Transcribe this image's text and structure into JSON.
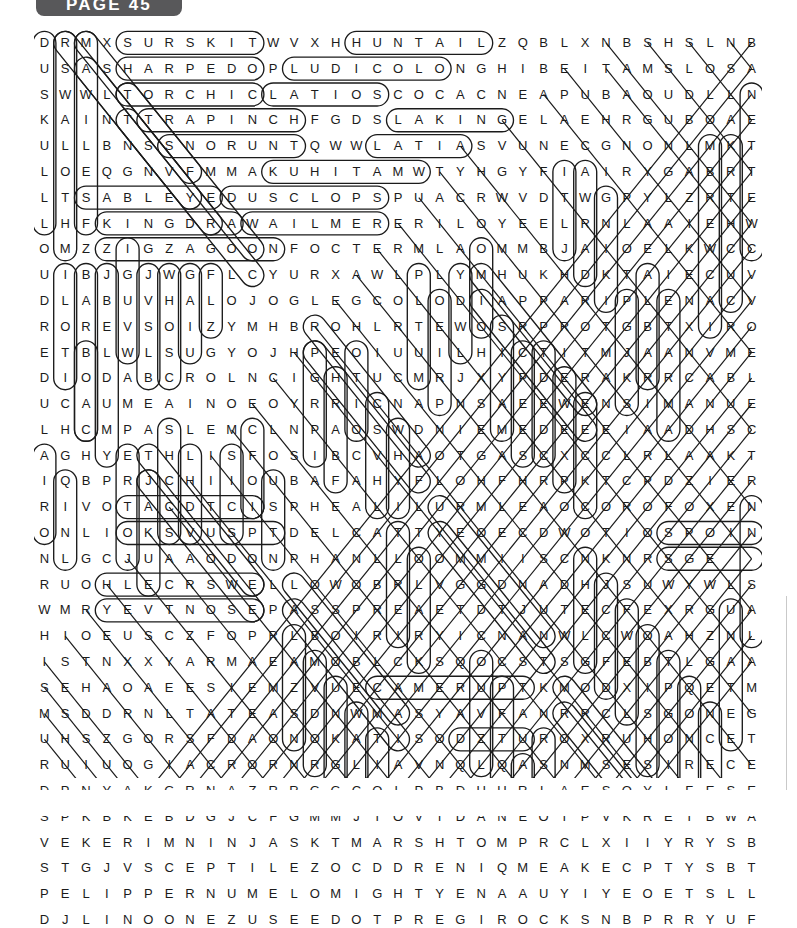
{
  "header": {
    "page_label": "PAGE 45"
  },
  "puzzle": {
    "kind": "word-search-solution",
    "rows": 29,
    "cols": 35,
    "ink_color": "#1b1b1b",
    "tab_color": "#58585a",
    "grid": [
      "DRMXSURSKITWVXHHUNTAILZQBLXNBSHSLNB",
      "USASHARPEDOPLUDICOLONGHIBEITAMSLOSA",
      "SWWLTORCHICLATIOSCOCACNEAPUBAOUDLLN",
      "KAINTTRAPINCHFGDSLAKINGELAEHRGUBOAE",
      "ULLBNSSNORUNTQWWLATIASVUNECGNONLMKT",
      "LOEQGNVFMMAKUHITAMWTYHGYFIAIRYGABRT",
      "LTSABLEYEDUSCLOPSPUACRWVDTWGPYLZRTE",
      "LHFKINGDRAWAILMERERILOYEELRNLAAIEHW",
      "OMZZIGZAGOONFOCTERMLAOMMBJAIOELKWCC",
      "UIBJGJWGFLCYURXAWLPLYMHUKHDKTAIECUV",
      "DLABUVHALOJOGLEGCOLODIAPPARIPLENACV",
      "ROREVSOIZYMHBROHLRTEWOSRPROTGBTXIRO",
      "ETBLWLSUGYOJHPEOIUUILHICTITMJAANVME",
      "DIODABCROLNCIGHTUCMRJXYPDERAKRRCABL",
      "UCAUMEAINOEOYRRICNAPNSAEEWENSIMANUE",
      "LHCMPASLEMCLNPAOSWDNIEMEDEEEIAADHSC",
      "AGHYETHLISFOSIBCVHAOTGASCXCCLRLAAKT",
      "IQBPRJCHIIOUBAFAHYFLOHFHRPKTCPDZIER",
      "RIVOTACDTCISPHEALILURMLEAOCOROFOXEN",
      "ONLIOKSVUSPTDELCATTYEOECDWOTIOSPOIN",
      "NLGCJUAAODONPHANLLOOMMIISCNKNRSGE",
      "RUOHLECRSWELLOWOBRLVGGDNADHJSUWYWLS",
      "WMRYEVTNOSEPASSPREAETDTJUTECFEXRGUA",
      "HIOEUSCZFOPRLBOIRIRYICNANWLCWOAHZNL",
      "ISTNXXYARMAEAMOBLCKSQOCSTSGFEBTLGAA",
      "SEHAOAEESIEMZVUECAMERUPTKMODXIPQETM",
      "MSDDRNLTATEASDNWMASYAVFANRRCLSGONEG",
      "UHSZGORSFDAONOKATISODZTUROXRUHONCET",
      "RUIUOGIACRORNRGLIAVNQLQASNMSESIRECE"
    ],
    "grid_tail": [
      "DPNYAKGRNAZRRGGCOLPBDUURLAESOYLFESEA",
      "SPKBKEBDGJCFGMMJTOVIDANEOIPVKRETBWAG",
      "VEKERIMNINJASKTMARSHTOMPRCLXIIYRYSBT",
      "STGJVSCEPTILEZOCDDRENIQMEAKECPTYSBTL",
      "PELIPPERNUMELOMIGHTYENAAUYIYEOETSLLF",
      "DJLINOONEZUSEEDOTPREGIROCKSNBPRRYUF"
    ],
    "found_words": [
      "SURSKIT",
      "HUNTAIL",
      "SHARPEDO",
      "LUDICOLO",
      "TORCHIC",
      "LATIOS",
      "TRAPINCH",
      "SLAKING",
      "SNORUNT",
      "LATIAS",
      "MAKUHITA",
      "SABLEYE",
      "DUSCLOPS",
      "KINGDRA",
      "WAILMER",
      "ZIGZAGOON",
      "BANETTE",
      "SPHEAL",
      "DELCATTY",
      "DONPHAN",
      "SWELLOW",
      "NOSEPASS",
      "SPOINK",
      "CAMERUPT",
      "MARSHTOMP",
      "SCEPTILE",
      "PELIPPER",
      "NUMEL",
      "MIGHTYENA",
      "LINOONE",
      "SEEDOT",
      "REGIROCK",
      "DUSKULL",
      "WALREIN",
      "MILOTIC",
      "BARBOACH",
      "CLAMPERL",
      "NINJASK"
    ]
  }
}
